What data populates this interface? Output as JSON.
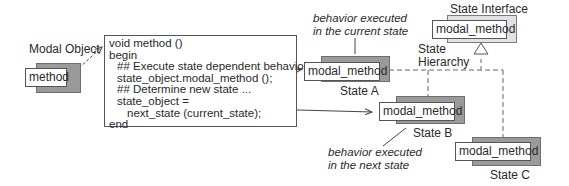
{
  "modal_object": {
    "title": "Modal Object",
    "method_label": "method"
  },
  "code_block": {
    "lines": [
      "void method ()",
      "begin",
      "## Execute state dependent behavior",
      "state_object.modal_method ();",
      "## Determine new state ...",
      "state_object =",
      "next_state (current_state);",
      "end"
    ]
  },
  "state_interface": {
    "title": "State Interface",
    "method_label": "modal_method"
  },
  "state_hierarchy_label": [
    "State",
    "Hierarchy"
  ],
  "states": [
    {
      "name": "State A",
      "method_label": "modal_method"
    },
    {
      "name": "State B",
      "method_label": "modal_method"
    },
    {
      "name": "State C",
      "method_label": "modal_method"
    }
  ],
  "annotations": {
    "current": [
      "behavior executed",
      "in the current state"
    ],
    "next": [
      "behavior executed",
      "in the next state"
    ]
  }
}
